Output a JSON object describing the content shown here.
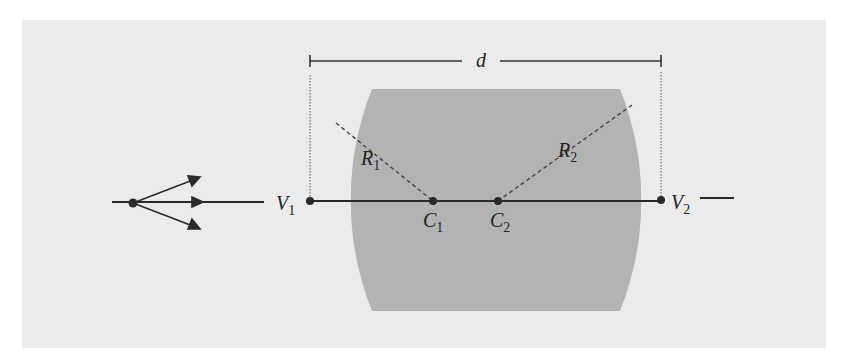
{
  "diagram": {
    "labels": {
      "thickness": "d",
      "radius1": "R",
      "radius1_sub": "1",
      "radius2": "R",
      "radius2_sub": "2",
      "vertex1": "V",
      "vertex1_sub": "1",
      "vertex2": "V",
      "vertex2_sub": "2",
      "center1": "C",
      "center1_sub": "1",
      "center2": "C",
      "center2_sub": "2"
    },
    "colors": {
      "panel": "#ebebeb",
      "lens": "#b3b3b3",
      "line": "#2a2a2a"
    }
  }
}
